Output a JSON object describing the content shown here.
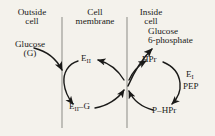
{
  "figure": {
    "background_color": "#f4f2ec",
    "ink_color": "#1a1a18",
    "membrane_line_color": "#8b8b85",
    "width": 215,
    "height": 136
  },
  "headers": {
    "outside": {
      "line1": "Outside",
      "line2": "cell"
    },
    "membrane": {
      "line1": "Cell",
      "line2": "membrane"
    },
    "inside": {
      "line1": "Inside",
      "line2": "cell"
    }
  },
  "substrate": {
    "line1": "Glucose",
    "line2": "(G)"
  },
  "product": {
    "line1": "Glucose",
    "line2": "6-phosphate"
  },
  "left_cycle": {
    "name": "enzyme-II-cycle",
    "top_node": {
      "base": "E",
      "sub": "II"
    },
    "bottom_node": {
      "base": "E",
      "sub": "II",
      "dash": "–",
      "tail": "G"
    }
  },
  "right_cycle": {
    "name": "HPr-cycle",
    "top_node": "HPr",
    "bottom_node": {
      "head": "P",
      "dash": "–",
      "tail": "HPr"
    }
  },
  "enzyme_I": {
    "base": "E",
    "sub": "I",
    "donor": "PEP"
  },
  "membrane_lines": [
    {
      "name": "outer-membrane-line",
      "x": 62
    },
    {
      "name": "inner-membrane-line",
      "x": 127
    }
  ]
}
